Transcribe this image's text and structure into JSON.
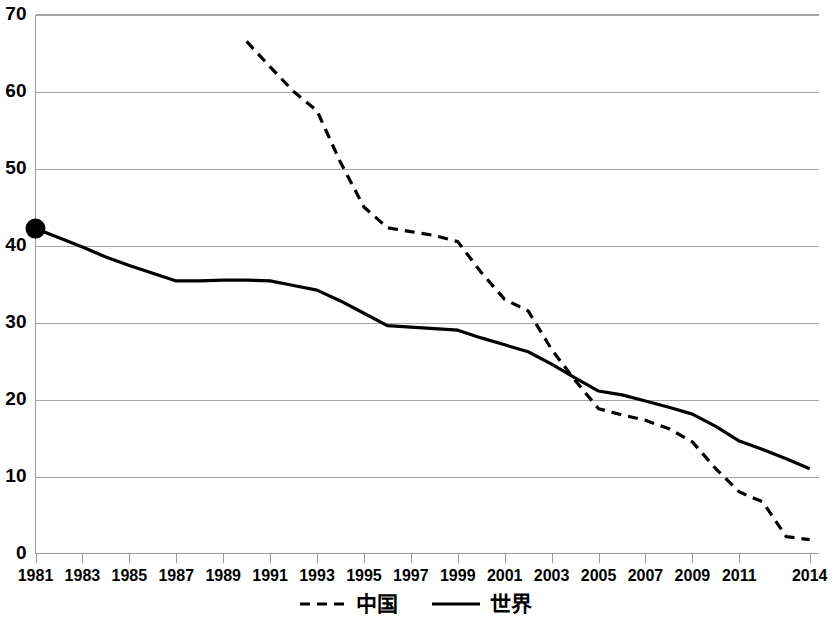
{
  "chart_data": {
    "type": "line",
    "title": "",
    "xlabel": "",
    "ylabel": "",
    "xlim": [
      1981,
      2014
    ],
    "ylim": [
      0,
      70
    ],
    "ytick_values": [
      0,
      10,
      20,
      30,
      40,
      50,
      60,
      70
    ],
    "ytick_labels": [
      "0",
      "10",
      "20",
      "30",
      "40",
      "50",
      "60",
      "70"
    ],
    "xtick_labels": [
      "1981",
      "1983",
      "1985",
      "1987",
      "1989",
      "1991",
      "1993",
      "1995",
      "1997",
      "1999",
      "2001",
      "2003",
      "2005",
      "2007",
      "2009",
      "2011",
      "2014"
    ],
    "xtick_values": [
      1981,
      1983,
      1985,
      1987,
      1989,
      1991,
      1993,
      1995,
      1997,
      1999,
      2001,
      2003,
      2005,
      2007,
      2009,
      2011,
      2014
    ],
    "grid": "horizontal",
    "legend_position": "bottom",
    "series": [
      {
        "name": "中国",
        "style": "dashed",
        "color": "#000000",
        "x": [
          1990,
          1991,
          1992,
          1993,
          1994,
          1995,
          1996,
          1997,
          1998,
          1999,
          2000,
          2001,
          2002,
          2003,
          2004,
          2005,
          2006,
          2007,
          2008,
          2009,
          2010,
          2011,
          2012,
          2013,
          2014
        ],
        "values": [
          66.5,
          63.2,
          60.0,
          57.5,
          50.8,
          45.0,
          42.3,
          41.8,
          41.3,
          40.5,
          36.5,
          33.0,
          31.5,
          26.5,
          22.5,
          18.8,
          18.0,
          17.3,
          16.2,
          14.5,
          11.0,
          8.0,
          6.7,
          2.2,
          1.8
        ]
      },
      {
        "name": "世界",
        "style": "solid",
        "color": "#000000",
        "x": [
          1981,
          1982,
          1983,
          1984,
          1985,
          1986,
          1987,
          1988,
          1989,
          1990,
          1991,
          1992,
          1993,
          1994,
          1995,
          1996,
          1997,
          1998,
          1999,
          2000,
          2001,
          2002,
          2003,
          2004,
          2005,
          2006,
          2007,
          2008,
          2009,
          2010,
          2011,
          2012,
          2013,
          2014
        ],
        "values": [
          42.2,
          41.0,
          39.8,
          38.5,
          37.4,
          36.4,
          35.4,
          35.4,
          35.5,
          35.5,
          35.4,
          34.8,
          34.2,
          32.8,
          31.2,
          29.6,
          29.4,
          29.2,
          29.0,
          28.0,
          27.1,
          26.2,
          24.6,
          22.8,
          21.1,
          20.6,
          19.8,
          19.0,
          18.1,
          16.5,
          14.6,
          13.5,
          12.3,
          11.0
        ]
      }
    ],
    "markers": [
      {
        "series": "世界",
        "x": 1981,
        "y": 42.2,
        "shape": "circle"
      }
    ]
  },
  "legend": {
    "items": [
      {
        "label": "中国",
        "style": "dashed"
      },
      {
        "label": "世界",
        "style": "solid"
      }
    ]
  }
}
